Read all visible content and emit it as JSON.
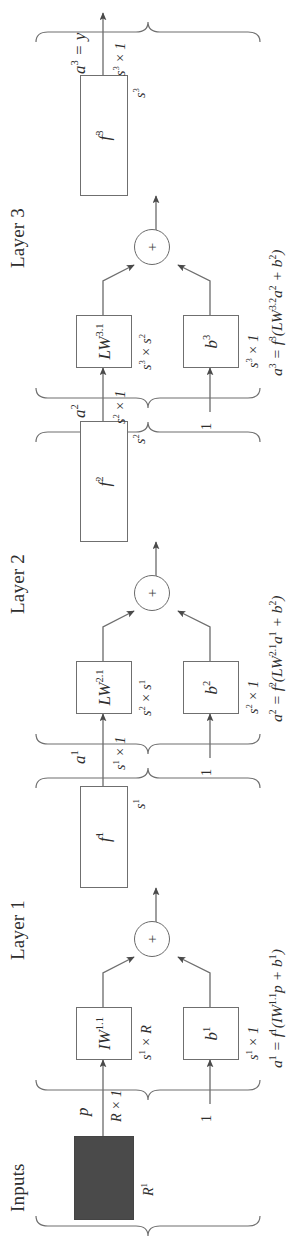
{
  "figure": {
    "orientation": "rotated-90-ccw",
    "ink_color": "#2e2e2e",
    "line_color": "#6f6f6f",
    "input_block_fill": "#4a4a4a"
  },
  "groups": [
    {
      "id": "inputs",
      "label": "Inputs"
    },
    {
      "id": "layer1",
      "label": "Layer 1"
    },
    {
      "id": "layer2",
      "label": "Layer 2"
    },
    {
      "id": "layer3",
      "label": "Layer 3"
    }
  ],
  "inputs": {
    "group_label": "Inputs",
    "block_dim_label": "R",
    "block_dim_sup": "1",
    "signal_name": "p",
    "signal_dim": "R × 1"
  },
  "layer1": {
    "group_label": "Layer 1",
    "weight": {
      "name": "IW",
      "sup": "1,1",
      "display": "IW",
      "dim_main": "s",
      "dim_sup": "1",
      "dim_rest": " × R",
      "dim_full": "s¹ × R"
    },
    "bias": {
      "name": "b",
      "sup": "1",
      "display": "b",
      "dim_full": "s¹ × 1"
    },
    "bias_input": "1",
    "sum_symbol": "+",
    "transfer": {
      "name": "f",
      "sup": "1",
      "display": "f"
    },
    "transfer_dim": "s¹",
    "output": {
      "name": "a",
      "sup": "1",
      "display": "a",
      "dim_full": "s¹ × 1"
    },
    "equation": "a¹ = f¹(IW¹·¹p + b¹)",
    "equation_parts": {
      "lhs": "a",
      "lhs_sup": "1",
      "f": "f",
      "f_sup": "1",
      "w": "IW",
      "w_sup": "1.1",
      "operand": "p",
      "b": "b",
      "b_sup": "1"
    }
  },
  "layer2": {
    "group_label": "Layer 2",
    "weight": {
      "name": "LW",
      "sup": "2,1",
      "display": "LW",
      "dim_full": "s² × s¹"
    },
    "bias": {
      "name": "b",
      "sup": "2",
      "display": "b",
      "dim_full": "s² × 1"
    },
    "bias_input": "1",
    "sum_symbol": "+",
    "transfer": {
      "name": "f",
      "sup": "2",
      "display": "f"
    },
    "transfer_dim": "s²",
    "output": {
      "name": "a",
      "sup": "2",
      "display": "a",
      "dim_full": "s² × 1"
    },
    "equation": "a² = f²(LW²·¹a¹ + b²)",
    "equation_parts": {
      "lhs": "a",
      "lhs_sup": "2",
      "f": "f",
      "f_sup": "2",
      "w": "LW",
      "w_sup": "2.1",
      "operand": "a",
      "operand_sup": "1",
      "b": "b",
      "b_sup": "2"
    }
  },
  "layer3": {
    "group_label": "Layer 3",
    "weight": {
      "name": "LW",
      "sup": "3,1",
      "display": "LW",
      "dim_full": "s³ × s²"
    },
    "bias": {
      "name": "b",
      "sup": "3",
      "display": "b",
      "dim_full": "s³ × 1"
    },
    "bias_input": "1",
    "sum_symbol": "+",
    "transfer": {
      "name": "f",
      "sup": "3",
      "display": "f"
    },
    "transfer_dim": "s³",
    "output": {
      "name": "a",
      "sup": "3",
      "display": "a",
      "dim_full": "s³ × 1",
      "alias": "y"
    },
    "output_label": "a³ = y",
    "equation": "a³ = f³(LW³·²a² + b²)",
    "equation_parts": {
      "lhs": "a",
      "lhs_sup": "3",
      "f": "f",
      "f_sup": "3",
      "w": "LW",
      "w_sup": "3.2",
      "operand": "a",
      "operand_sup": "2",
      "b": "b",
      "b_sup": "2"
    }
  }
}
